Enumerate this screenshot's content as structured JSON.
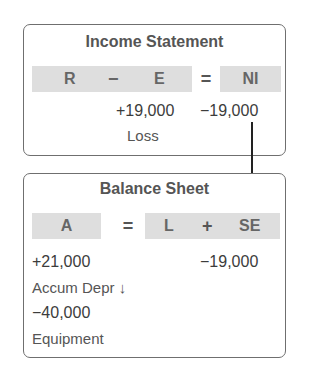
{
  "income_statement": {
    "title": "Income Statement",
    "equation": {
      "r": "R",
      "minus": "−",
      "e": "E",
      "equals": "=",
      "ni": "NI"
    },
    "e_value": "+19,000",
    "ni_value": "−19,000",
    "e_label": "Loss"
  },
  "balance_sheet": {
    "title": "Balance Sheet",
    "equation": {
      "a": "A",
      "equals": "=",
      "l": "L",
      "plus": "+",
      "se": "SE"
    },
    "a_entries": [
      {
        "value": "+21,000",
        "label": "Accum Depr ↓"
      },
      {
        "value": "−40,000",
        "label": "Equipment"
      }
    ],
    "se_value": "−19,000"
  },
  "colors": {
    "cell_bg": "#dedede",
    "border": "#6f6f6f",
    "arrow": "#222222"
  }
}
